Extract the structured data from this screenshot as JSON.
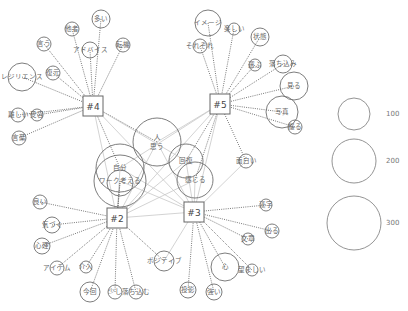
{
  "diagram": {
    "type": "co-occurrence network",
    "hubs": [
      {
        "id": "h4",
        "label": "#4",
        "x": 93,
        "y": 106
      },
      {
        "id": "h5",
        "label": "#5",
        "x": 220,
        "y": 104
      },
      {
        "id": "h2",
        "label": "#2",
        "x": 117,
        "y": 218
      },
      {
        "id": "h3",
        "label": "#3",
        "x": 194,
        "y": 212
      }
    ],
    "words": [
      {
        "label": "言う",
        "x": 44,
        "y": 44,
        "r": 7,
        "hubs": [
          "h4"
        ]
      },
      {
        "label": "他者",
        "x": 72,
        "y": 29,
        "r": 7,
        "hubs": [
          "h4"
        ]
      },
      {
        "label": "多い",
        "x": 101,
        "y": 19,
        "r": 9,
        "hubs": [
          "h4"
        ]
      },
      {
        "label": "アドバイス",
        "x": 90,
        "y": 50,
        "r": 8,
        "hubs": [
          "h4"
        ]
      },
      {
        "label": "転機",
        "x": 123,
        "y": 45,
        "r": 7,
        "hubs": [
          "h4"
        ]
      },
      {
        "label": "レジリエンス",
        "x": 22,
        "y": 77,
        "r": 14,
        "hubs": [
          "h4"
        ]
      },
      {
        "label": "復元",
        "x": 53,
        "y": 73,
        "r": 7,
        "hubs": [
          "h4"
        ]
      },
      {
        "label": "難しい",
        "x": 18,
        "y": 115,
        "r": 7,
        "hubs": [
          "h4"
        ]
      },
      {
        "label": "受容",
        "x": 37,
        "y": 115,
        "r": 6,
        "hubs": [
          "h4"
        ]
      },
      {
        "label": "言葉",
        "x": 19,
        "y": 138,
        "r": 7,
        "hubs": [
          "h4"
        ]
      },
      {
        "label": "イメージ",
        "x": 208,
        "y": 23,
        "r": 13,
        "hubs": [
          "h5"
        ]
      },
      {
        "label": "楽しい",
        "x": 234,
        "y": 29,
        "r": 6,
        "hubs": [
          "h5"
        ]
      },
      {
        "label": "それぞれ",
        "x": 200,
        "y": 46,
        "r": 7,
        "hubs": [
          "h5"
        ]
      },
      {
        "label": "状態",
        "x": 260,
        "y": 37,
        "r": 9,
        "hubs": [
          "h5"
        ]
      },
      {
        "label": "選ぶ",
        "x": 255,
        "y": 65,
        "r": 6,
        "hubs": [
          "h5"
        ]
      },
      {
        "label": "落ち込み",
        "x": 283,
        "y": 64,
        "r": 9,
        "hubs": [
          "h5"
        ]
      },
      {
        "label": "見る",
        "x": 294,
        "y": 86,
        "r": 14,
        "hubs": [
          "h5"
        ]
      },
      {
        "label": "写真",
        "x": 282,
        "y": 112,
        "r": 16,
        "hubs": [
          "h5"
        ]
      },
      {
        "label": "撮る",
        "x": 295,
        "y": 127,
        "r": 7,
        "hubs": [
          "h5"
        ]
      },
      {
        "label": "面白い",
        "x": 246,
        "y": 161,
        "r": 7,
        "hubs": [
          "h5",
          "h3"
        ]
      },
      {
        "label": "人\n思う",
        "x": 157,
        "y": 142,
        "r": 24,
        "hubs": [
          "h4",
          "h5",
          "h2",
          "h3"
        ]
      },
      {
        "label": "回復",
        "x": 186,
        "y": 161,
        "r": 17,
        "hubs": [
          "h5",
          "h3",
          "h2",
          "h4"
        ]
      },
      {
        "label": "感じる",
        "x": 195,
        "y": 180,
        "r": 18,
        "hubs": [
          "h5",
          "h3",
          "h2"
        ]
      },
      {
        "label": "自分",
        "x": 120,
        "y": 168,
        "r": 24,
        "hubs": [
          "h4",
          "h2",
          "h3",
          "h5"
        ]
      },
      {
        "label": "ワーク考える",
        "x": 120,
        "y": 181,
        "r": 26,
        "hubs": [
          "h2",
          "h3"
        ]
      },
      {
        "label": "",
        "x": 120,
        "y": 183,
        "r": 13,
        "hubs": [
          "h2"
        ]
      },
      {
        "label": "良い",
        "x": 40,
        "y": 202,
        "r": 7,
        "hubs": [
          "h2"
        ]
      },
      {
        "label": "気づく",
        "x": 52,
        "y": 225,
        "r": 8,
        "hubs": [
          "h2"
        ]
      },
      {
        "label": "心理",
        "x": 42,
        "y": 246,
        "r": 8,
        "hubs": [
          "h2"
        ]
      },
      {
        "label": "アイテム",
        "x": 57,
        "y": 268,
        "r": 7,
        "hubs": [
          "h2"
        ]
      },
      {
        "label": "介入",
        "x": 86,
        "y": 267,
        "r": 6,
        "hubs": [
          "h2"
        ]
      },
      {
        "label": "今回",
        "x": 90,
        "y": 292,
        "r": 10,
        "hubs": [
          "h2"
        ]
      },
      {
        "label": "少し",
        "x": 115,
        "y": 292,
        "r": 7,
        "hubs": [
          "h2"
        ]
      },
      {
        "label": "落ち込む",
        "x": 136,
        "y": 292,
        "r": 7,
        "hubs": [
          "h2"
        ]
      },
      {
        "label": "ポジティブ",
        "x": 164,
        "y": 261,
        "r": 10,
        "hubs": [
          "h2",
          "h3"
        ]
      },
      {
        "label": "漢字",
        "x": 266,
        "y": 205,
        "r": 6,
        "hubs": [
          "h3"
        ]
      },
      {
        "label": "出る",
        "x": 272,
        "y": 231,
        "r": 7,
        "hubs": [
          "h3"
        ]
      },
      {
        "label": "文章",
        "x": 248,
        "y": 239,
        "r": 6,
        "hubs": [
          "h3"
        ]
      },
      {
        "label": "心",
        "x": 225,
        "y": 267,
        "r": 14,
        "hubs": [
          "h3"
        ]
      },
      {
        "label": "望ましい",
        "x": 252,
        "y": 270,
        "r": 6,
        "hubs": [
          "h3"
        ]
      },
      {
        "label": "投影",
        "x": 188,
        "y": 290,
        "r": 8,
        "hubs": [
          "h3"
        ]
      },
      {
        "label": "強い",
        "x": 214,
        "y": 292,
        "r": 8,
        "hubs": [
          "h3"
        ]
      }
    ],
    "cross_edges": [
      [
        "h4",
        "h3"
      ],
      [
        "h4",
        "h2"
      ],
      [
        "h5",
        "h2"
      ],
      [
        "h5",
        "h3"
      ],
      [
        "h2",
        "h3"
      ]
    ],
    "legend": {
      "items": [
        {
          "label": "100",
          "x": 354,
          "y": 114,
          "r": 16
        },
        {
          "label": "200",
          "x": 354,
          "y": 161,
          "r": 22
        },
        {
          "label": "300",
          "x": 354,
          "y": 223,
          "r": 27
        }
      ]
    }
  }
}
